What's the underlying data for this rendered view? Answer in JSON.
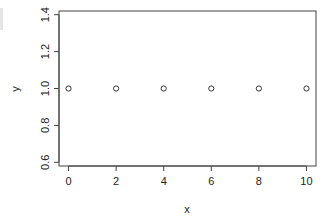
{
  "chart_data": {
    "type": "scatter",
    "title": "",
    "xlabel": "x",
    "ylabel": "y",
    "x": [
      0,
      2,
      4,
      6,
      8,
      10
    ],
    "y": [
      1,
      1,
      1,
      1,
      1,
      1
    ],
    "xlim": [
      -0.4,
      10.4
    ],
    "ylim": [
      0.58,
      1.42
    ],
    "xticks": [
      0,
      2,
      4,
      6,
      8,
      10
    ],
    "yticks": [
      0.6,
      0.8,
      1.0,
      1.2,
      1.4
    ],
    "xtick_labels": [
      "0",
      "2",
      "4",
      "6",
      "8",
      "10"
    ],
    "ytick_labels": [
      "0.6",
      "0.8",
      "1.0",
      "1.2",
      "1.4"
    ],
    "marker": "open-circle",
    "grid": false,
    "legend": null
  }
}
